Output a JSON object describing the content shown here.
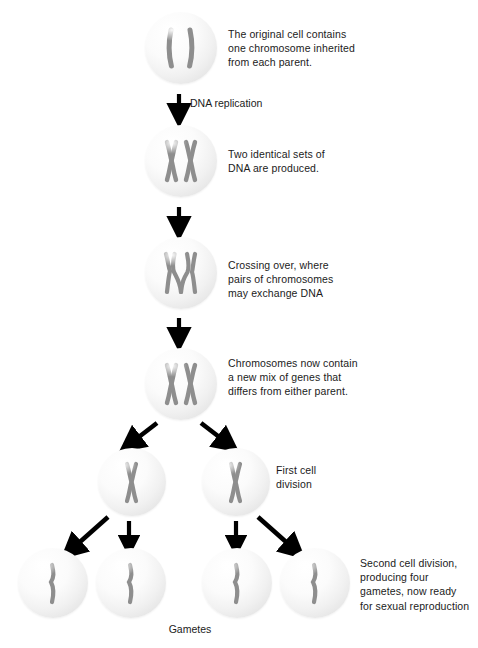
{
  "diagram": {
    "chromosome_color": "#8e8e8e",
    "cell_fill": "#efefef",
    "text_color": "#1b1b1b",
    "arrow_color": "#000000"
  },
  "stages": [
    {
      "id": "original-cell",
      "caption": "The original cell contains\none chromosome inherited\nfrom each parent.",
      "chromosome_type": "two-bars",
      "cells": 1
    },
    {
      "id": "replicated-cell",
      "caption": "Two identical sets of\nDNA are produced.",
      "chromosome_type": "two-x",
      "cells": 1
    },
    {
      "id": "crossing-over-cell",
      "caption": "Crossing over, where\npairs of chromosomes\nmay exchange DNA",
      "chromosome_type": "crossed-x",
      "cells": 1
    },
    {
      "id": "recombined-cell",
      "caption": "Chromosomes now contain\na new mix of genes that\ndiffers from either parent.",
      "chromosome_type": "two-x",
      "cells": 1
    },
    {
      "id": "first-division",
      "caption": "First cell\ndivision",
      "chromosome_type": "single-x",
      "cells": 2
    },
    {
      "id": "second-division",
      "caption": "Second cell division,\nproducing four\ngametes, now ready\nfor sexual reproduction",
      "chromosome_type": "single-bar",
      "cells": 4
    }
  ],
  "arrow_labels": {
    "dna_replication": "DNA replication"
  },
  "footer_label": {
    "gametes": "Gametes"
  }
}
